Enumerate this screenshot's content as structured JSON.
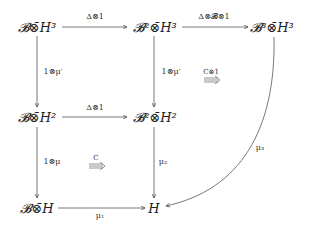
{
  "diagram": {
    "type": "commutative-diagram",
    "nodes": [
      {
        "id": "BH3",
        "label": "𝓑⊗̄H³",
        "x": 37,
        "y": 27
      },
      {
        "id": "B2H3",
        "label": "𝓑²⊗̄H³",
        "x": 155,
        "y": 27
      },
      {
        "id": "B3H3",
        "label": "𝓑³⊗̄H³",
        "x": 272,
        "y": 27
      },
      {
        "id": "BH2",
        "label": "𝓑⊗̄H²",
        "x": 37,
        "y": 117
      },
      {
        "id": "B2H2",
        "label": "𝓑²⊗̄H²",
        "x": 155,
        "y": 117
      },
      {
        "id": "BH",
        "label": "𝓑⊗̄H",
        "x": 37,
        "y": 208
      },
      {
        "id": "H",
        "label": "H",
        "x": 154,
        "y": 208
      }
    ],
    "edges": [
      {
        "from": "BH3",
        "to": "B2H3",
        "label": "Δ⊗1"
      },
      {
        "from": "B2H3",
        "to": "B3H3",
        "label": "Δ⊗𝓑⊗1"
      },
      {
        "from": "BH3",
        "to": "BH2",
        "label": "1⊗μ′"
      },
      {
        "from": "B2H3",
        "to": "B2H2",
        "label": "1⊗μ′"
      },
      {
        "from": "BH2",
        "to": "B2H2",
        "label": "Δ⊗1"
      },
      {
        "from": "BH2",
        "to": "BH",
        "label": "1⊗μ"
      },
      {
        "from": "B2H2",
        "to": "H",
        "label": "μ₂"
      },
      {
        "from": "BH",
        "to": "H",
        "label": "μ₁"
      },
      {
        "from": "B3H3",
        "to": "H",
        "label": "μ₃"
      }
    ],
    "two_cells": [
      {
        "label": "C⊗1",
        "symbol": "⟹"
      },
      {
        "label": "C",
        "symbol": "⟹"
      }
    ]
  }
}
